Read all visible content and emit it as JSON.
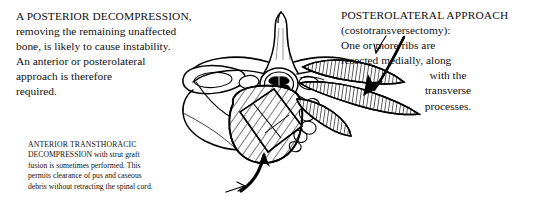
{
  "figure": {
    "background_color": "#ffffff",
    "ink_color": "#000000"
  },
  "annotations": {
    "posterior_decompression": {
      "heading": "A POSTERIOR DECOMPRESSION,",
      "lines": [
        "removing the remaining unaffected",
        "bone, is likely to cause instability.",
        "An anterior or posterolateral",
        "approach is therefore",
        "required."
      ]
    },
    "posterolateral_approach": {
      "heading": "POSTEROLATERAL APPROACH",
      "lines": [
        "(costotransversectomy):",
        "One or more ribs are",
        "resected medially, along"
      ],
      "centered_lines": [
        "with the",
        "transverse",
        "processes."
      ]
    },
    "anterior_transthoracic": {
      "heading": "ANTERIOR TRANSTHORACIC",
      "lines": [
        "DECOMPRESSION with strut graft",
        "fusion is sometimes performed. This",
        "permits clearance of pus and caseous",
        "debris without retracting the spinal cord."
      ],
      "heading_continuation": "DECOMPRESSION"
    }
  },
  "anatomy": {
    "labels": [
      "spinous-process",
      "lamina",
      "spinal-canal",
      "spinal-cord",
      "vertebral-body",
      "pedicle",
      "transverse-process",
      "rib-left",
      "rib-right",
      "costovertebral-joint",
      "caseous-debris"
    ]
  },
  "arrows": {
    "posterolateral_pointer": "thin-arrow-down-left",
    "rib_resection_pointer": "thick-arrow-down-left",
    "anterior_approach_pointer": "thick-curved-arrow-up"
  }
}
